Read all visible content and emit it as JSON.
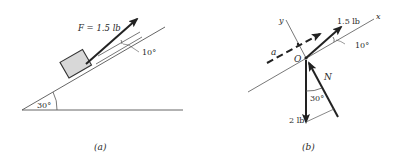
{
  "figure_a": {
    "caption": "(a)",
    "force_label": "F = 1.5 lb",
    "force_angle_label": "10°",
    "incline_angle_label": "30°"
  },
  "figure_b": {
    "caption": "(b)",
    "origin_label": "O",
    "x_axis_label": "x",
    "y_axis_label": "y",
    "acceleration_label": "a",
    "applied_force_label": "1.5 lb",
    "applied_angle_label": "10°",
    "weight_label": "2 lb",
    "normal_label": "N",
    "normal_angle_label": "30°"
  },
  "colors": {
    "line": "#555555",
    "arrow": "#222222",
    "block_fill": "#d8d8d8",
    "text": "#2a2a2a"
  }
}
